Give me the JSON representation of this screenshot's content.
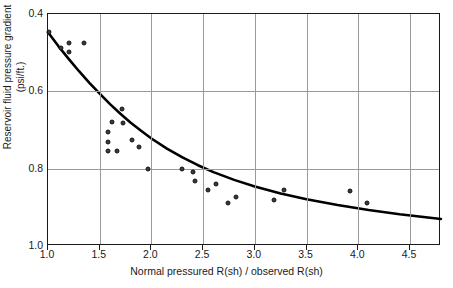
{
  "chart_data": {
    "type": "scatter",
    "title": "",
    "xlabel": "Normal pressured R(sh) / observed R(sh)",
    "ylabel": "Reservoir fluid pressure gradient (psi/ft.)",
    "xlim": [
      1.0,
      4.8
    ],
    "ylim": [
      0.4,
      1.0
    ],
    "y_axis_inverted": true,
    "grid": true,
    "legend": null,
    "xticks": [
      1.0,
      1.5,
      2.0,
      2.5,
      3.0,
      3.5,
      4.0,
      4.5
    ],
    "xtick_labels": [
      "1.0",
      "1.5",
      "2.0",
      "2.5",
      "3.0",
      "3.5",
      "4.0",
      "4.5"
    ],
    "yticks": [
      0.4,
      0.6,
      0.8,
      1.0
    ],
    "ytick_labels": [
      "0.4",
      "0.6",
      "0.8",
      "1.0"
    ],
    "series": [
      {
        "name": "Measured wells",
        "type": "scatter",
        "marker": "filled-circle",
        "color": "#3b3b3b",
        "points": [
          {
            "x": 1.01,
            "y": 0.447
          },
          {
            "x": 1.13,
            "y": 0.488
          },
          {
            "x": 1.2,
            "y": 0.475
          },
          {
            "x": 1.2,
            "y": 0.497
          },
          {
            "x": 1.35,
            "y": 0.475
          },
          {
            "x": 1.58,
            "y": 0.705
          },
          {
            "x": 1.58,
            "y": 0.73
          },
          {
            "x": 1.58,
            "y": 0.755
          },
          {
            "x": 1.62,
            "y": 0.68
          },
          {
            "x": 1.67,
            "y": 0.755
          },
          {
            "x": 1.72,
            "y": 0.645
          },
          {
            "x": 1.73,
            "y": 0.682
          },
          {
            "x": 1.81,
            "y": 0.725
          },
          {
            "x": 1.88,
            "y": 0.745
          },
          {
            "x": 1.97,
            "y": 0.8
          },
          {
            "x": 2.3,
            "y": 0.8
          },
          {
            "x": 2.4,
            "y": 0.808
          },
          {
            "x": 2.42,
            "y": 0.833
          },
          {
            "x": 2.55,
            "y": 0.855
          },
          {
            "x": 2.62,
            "y": 0.84
          },
          {
            "x": 2.74,
            "y": 0.89
          },
          {
            "x": 2.82,
            "y": 0.872
          },
          {
            "x": 3.19,
            "y": 0.882
          },
          {
            "x": 3.28,
            "y": 0.855
          },
          {
            "x": 3.92,
            "y": 0.857
          },
          {
            "x": 4.08,
            "y": 0.89
          }
        ]
      },
      {
        "name": "Fitted trend",
        "type": "line",
        "color": "#000000",
        "points": [
          {
            "x": 1.0,
            "y": 0.447
          },
          {
            "x": 1.1,
            "y": 0.483
          },
          {
            "x": 1.2,
            "y": 0.516
          },
          {
            "x": 1.3,
            "y": 0.548
          },
          {
            "x": 1.4,
            "y": 0.578
          },
          {
            "x": 1.5,
            "y": 0.606
          },
          {
            "x": 1.6,
            "y": 0.633
          },
          {
            "x": 1.7,
            "y": 0.658
          },
          {
            "x": 1.8,
            "y": 0.681
          },
          {
            "x": 1.9,
            "y": 0.702
          },
          {
            "x": 2.0,
            "y": 0.722
          },
          {
            "x": 2.15,
            "y": 0.748
          },
          {
            "x": 2.3,
            "y": 0.771
          },
          {
            "x": 2.45,
            "y": 0.791
          },
          {
            "x": 2.6,
            "y": 0.809
          },
          {
            "x": 2.8,
            "y": 0.829
          },
          {
            "x": 3.0,
            "y": 0.846
          },
          {
            "x": 3.25,
            "y": 0.864
          },
          {
            "x": 3.5,
            "y": 0.879
          },
          {
            "x": 3.8,
            "y": 0.894
          },
          {
            "x": 4.1,
            "y": 0.907
          },
          {
            "x": 4.4,
            "y": 0.918
          },
          {
            "x": 4.8,
            "y": 0.93
          }
        ]
      }
    ]
  }
}
